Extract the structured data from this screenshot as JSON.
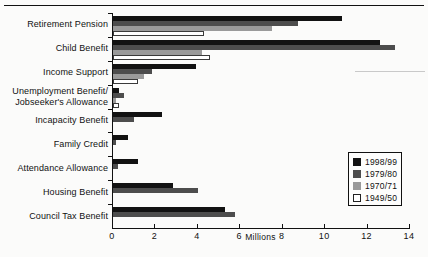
{
  "chart_data": {
    "type": "bar",
    "orientation": "horizontal",
    "title": "",
    "xlabel": "Millions",
    "ylabel": "",
    "xlim": [
      0,
      14
    ],
    "xticks": [
      0,
      2,
      4,
      6,
      8,
      10,
      12,
      14
    ],
    "xticklabels": [
      "0",
      "2",
      "4",
      "6",
      "8",
      "10",
      "12",
      "14"
    ],
    "grid": false,
    "legend_position": "center-right",
    "categories": [
      "Retirement Pension",
      "Child Benefit",
      "Income Support",
      "Unemployment Benefit/ Jobseeker's Allowance",
      "Incapacity Benefit",
      "Family Credit",
      "Attendance Allowance",
      "Housing Benefit",
      "Council Tax Benefit"
    ],
    "category_lines": [
      [
        "Retirement Pension"
      ],
      [
        "Child Benefit"
      ],
      [
        "Income Support"
      ],
      [
        "Unemployment Benefit/",
        "Jobseeker's Allowance"
      ],
      [
        "Incapacity Benefit"
      ],
      [
        "Family Credit"
      ],
      [
        "Attendance Allowance"
      ],
      [
        "Housing Benefit"
      ],
      [
        "Council Tax Benefit"
      ]
    ],
    "series": [
      {
        "name": "1998/99",
        "color": "#121212",
        "values": [
          10.8,
          12.6,
          3.9,
          0.3,
          2.3,
          0.7,
          1.2,
          2.85,
          5.3
        ]
      },
      {
        "name": "1979/80",
        "color": "#4d4d4d",
        "values": [
          8.7,
          13.3,
          1.85,
          0.5,
          1.0,
          0.15,
          0.25,
          4.0,
          5.75
        ]
      },
      {
        "name": "1970/71",
        "color": "#9a9a9a",
        "values": [
          7.5,
          4.2,
          1.45,
          0.15,
          0,
          0,
          0,
          0,
          0
        ]
      },
      {
        "name": "1949/50",
        "color": "#ffffff",
        "values": [
          4.2,
          4.5,
          1.1,
          0.2,
          0,
          0,
          0,
          0,
          0
        ]
      }
    ]
  },
  "legend": {
    "entries": [
      {
        "label": "1998/99",
        "color": "#121212"
      },
      {
        "label": "1979/80",
        "color": "#4d4d4d"
      },
      {
        "label": "1970/71",
        "color": "#9a9a9a"
      },
      {
        "label": "1949/50",
        "color": "#ffffff"
      }
    ]
  }
}
